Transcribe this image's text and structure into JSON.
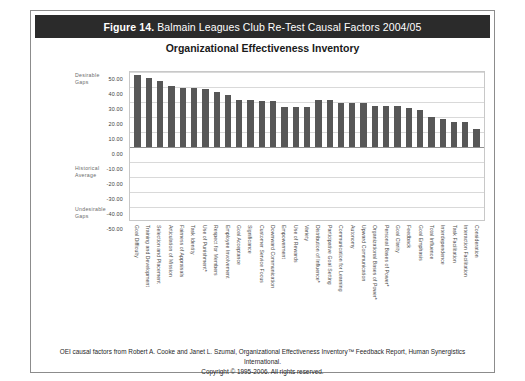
{
  "figure": {
    "number": "Figure 14.",
    "caption": "Balmain Leagues Club Re-Test Causal Factors 2004/05",
    "subtitle": "Organizational Effectiveness Inventory"
  },
  "annotations": {
    "desirable": "Desirable\nGaps",
    "historical": "Historical\nAverage",
    "undesirable": "Undesirable\nGaps"
  },
  "footer": {
    "line1": "OEI causal factors from Robert A. Cooke and Janet L. Szumal, Organizational Effectiveness Inventory™ Feedback Report, Human Synergistics International.",
    "line2": "Copyright © 1995-2006. All rights reserved."
  },
  "colors": {
    "title_bar_bg": "#2b2b2b",
    "title_bar_text": "#ffffff",
    "bar_fill": "#575757",
    "gridline": "#d9d9d9",
    "plot_border": "#c8c8c8",
    "card_border": "#8c8c8c"
  },
  "chart_data": {
    "type": "bar",
    "title": "Organizational Effectiveness Inventory",
    "xlabel": "",
    "ylabel": "",
    "ylim": [
      -50,
      50
    ],
    "yticks": [
      50.0,
      40.0,
      30.0,
      20.0,
      10.0,
      0.0,
      -10.0,
      -20.0,
      -30.0,
      -40.0,
      -50.0
    ],
    "ytick_labels": [
      "50.00",
      "40.00",
      "30.00",
      "20.00",
      "10.00",
      "0.00",
      "-10.00",
      "-20.00",
      "-30.00",
      "-40.00",
      "-50.00"
    ],
    "grid": true,
    "legend": null,
    "categories": [
      "Goal Difficulty",
      "Training and Development",
      "Selection and Placement",
      "Articulation of Mission",
      "Fairness of Appraisals",
      "Task Identity",
      "Use of Punishment*",
      "Respect for Members",
      "Employee Involvement",
      "Goal Acceptance",
      "Significance",
      "Customer Service Focus",
      "Downward Communication",
      "Empowerment",
      "Use of Rewards",
      "Variety",
      "Distribution of Influence*",
      "Participative Goal Setting",
      "Communication for Learning",
      "Autonomy",
      "Upward Communication",
      "Organizational Bases of Power*",
      "Personal Bases of Power*",
      "Goal Clarity",
      "Feedback",
      "Goal Emphasis",
      "Total Influence",
      "Interdependence",
      "Task Facilitation",
      "Interaction Facilitation",
      "Consideration"
    ],
    "values": [
      48.0,
      46.0,
      44.0,
      40.5,
      39.5,
      39.5,
      38.5,
      36.5,
      34.5,
      31.5,
      31.5,
      30.5,
      30.5,
      26.5,
      26.5,
      26.5,
      31.5,
      31.5,
      29.5,
      29.5,
      29.5,
      27.5,
      27.5,
      27.5,
      26.0,
      25.0,
      20.0,
      18.5,
      16.5,
      16.5,
      12.0
    ]
  }
}
